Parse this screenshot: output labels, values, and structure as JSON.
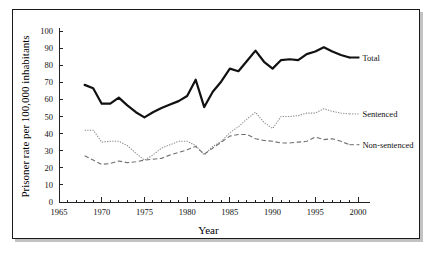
{
  "chart_data": {
    "type": "line",
    "title": "",
    "xlabel": "Year",
    "ylabel": "Prisoner rate per 100,000 inhabitants",
    "xlim": [
      1965,
      2000
    ],
    "ylim": [
      0,
      100
    ],
    "xticks": [
      1965,
      1970,
      1975,
      1980,
      1985,
      1990,
      1995,
      2000
    ],
    "xtick_labels": [
      "1965",
      "1970",
      "1975",
      "1980",
      "1985",
      "1990",
      "1995",
      "2000"
    ],
    "xminor_step": 1,
    "yticks": [
      0,
      10,
      20,
      30,
      40,
      50,
      60,
      70,
      80,
      90,
      100
    ],
    "ytick_labels": [
      "0",
      "10",
      "20",
      "30",
      "40",
      "50",
      "60",
      "70",
      "80",
      "90",
      "100"
    ],
    "grid": false,
    "legend_position": "right-inline",
    "x": [
      1968,
      1969,
      1970,
      1971,
      1972,
      1973,
      1974,
      1975,
      1976,
      1977,
      1978,
      1979,
      1980,
      1981,
      1982,
      1983,
      1984,
      1985,
      1986,
      1987,
      1988,
      1989,
      1990,
      1991,
      1992,
      1993,
      1994,
      1995,
      1996,
      1997,
      1998,
      1999
    ],
    "series": [
      {
        "name": "Total",
        "style": "solid-thick",
        "color": "#111111",
        "values": [
          68.5,
          66.5,
          57.5,
          57.5,
          61.0,
          56.5,
          52.5,
          49.5,
          52.5,
          55.0,
          57.0,
          59.0,
          62.0,
          71.5,
          55.5,
          64.5,
          70.5,
          78.0,
          76.5,
          82.5,
          88.5,
          82.0,
          78.0,
          83.0,
          83.5,
          83.0,
          86.5,
          88.0,
          90.5,
          88.0,
          86.0,
          84.5
        ]
      },
      {
        "name": "Sentenced",
        "style": "dotted",
        "color": "#8c8c8c",
        "values": [
          42.0,
          42.0,
          35.0,
          35.5,
          35.5,
          33.0,
          28.5,
          24.5,
          27.5,
          31.5,
          33.5,
          35.5,
          35.5,
          33.0,
          27.5,
          32.5,
          35.5,
          40.5,
          44.0,
          48.5,
          52.5,
          46.5,
          43.0,
          50.0,
          50.0,
          50.5,
          52.0,
          52.0,
          54.5,
          53.0,
          52.0,
          51.5
        ]
      },
      {
        "name": "Non-sentenced",
        "style": "dashed",
        "color": "#6e6e6e",
        "values": [
          27.0,
          24.5,
          22.0,
          22.5,
          24.0,
          23.0,
          23.5,
          24.5,
          25.0,
          25.5,
          27.5,
          29.0,
          30.5,
          32.5,
          28.0,
          31.5,
          35.0,
          38.5,
          39.5,
          39.5,
          37.0,
          36.0,
          35.5,
          34.5,
          34.5,
          35.0,
          35.5,
          38.0,
          36.5,
          37.0,
          35.5,
          33.5
        ]
      }
    ],
    "annotations": [
      {
        "text": "Total",
        "near_series": "Total"
      },
      {
        "text": "Sentenced",
        "near_series": "Sentenced"
      },
      {
        "text": "Non-sentenced",
        "near_series": "Non-sentenced"
      }
    ]
  }
}
